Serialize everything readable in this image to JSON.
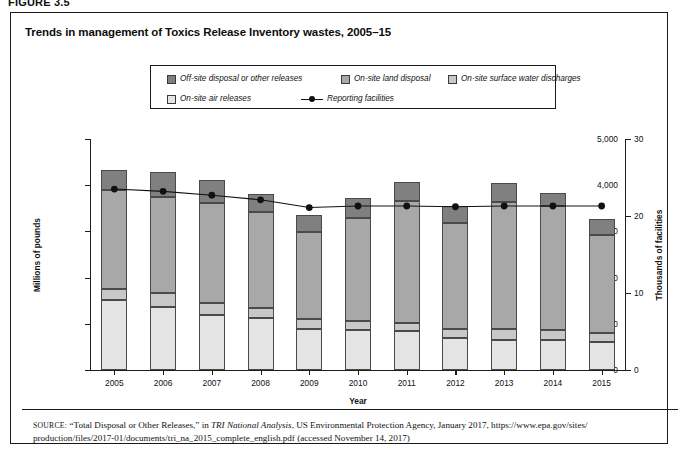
{
  "figure": {
    "number": "FIGURE 3.5"
  },
  "chart_title": "Trends in management of Toxics Release Inventory wastes, 2005–15",
  "legend": {
    "items": [
      {
        "label": "Off-site disposal or other releases",
        "color": "#808080",
        "type": "swatch"
      },
      {
        "label": "On-site land disposal",
        "color": "#a8a8a8",
        "type": "swatch"
      },
      {
        "label": "On-site surface water discharges",
        "color": "#c8c8c8",
        "type": "swatch"
      },
      {
        "label": "On-site air releases",
        "color": "#e4e4e4",
        "type": "swatch"
      },
      {
        "label": "Reporting facilities",
        "color": "#111111",
        "type": "line"
      }
    ]
  },
  "axes": {
    "left_title": "Millions of pounds",
    "right_title": "Thousands of facilities",
    "x_title": "Year",
    "left_ticks": [
      "0",
      "1,000",
      "2,000",
      "3,000",
      "4,000",
      "5,000"
    ],
    "right_ticks": [
      "0",
      "10",
      "20",
      "30"
    ]
  },
  "source": {
    "prefix": "SOURCE:",
    "line1_a": " “Total Disposal or Other Releases,” in ",
    "line1_italic": "TRI National Analysis",
    "line1_b": ", US Environmental Protection Agency, January 2017, https://www.epa.gov/sites/",
    "line2": "production/files/2017-01/documents/tri_na_2015_complete_english.pdf (accessed November 14, 2017)"
  },
  "chart_data": {
    "type": "bar",
    "subtype": "stacked-bar-with-line",
    "title": "Trends in management of Toxics Release Inventory wastes, 2005–15",
    "xlabel": "Year",
    "ylabel": "Millions of pounds",
    "y2label": "Thousands of facilities",
    "categories": [
      "2005",
      "2006",
      "2007",
      "2008",
      "2009",
      "2010",
      "2011",
      "2012",
      "2013",
      "2014",
      "2015"
    ],
    "ylim": [
      0,
      5000
    ],
    "y2lim": [
      0,
      30
    ],
    "grid": false,
    "legend_position": "top-center",
    "series": [
      {
        "name": "On-site air releases",
        "color": "#e4e4e4",
        "values": [
          1510,
          1360,
          1200,
          1125,
          895,
          855,
          840,
          700,
          655,
          640,
          600
        ]
      },
      {
        "name": "On-site surface water discharges",
        "color": "#c8c8c8",
        "values": [
          235,
          300,
          250,
          215,
          205,
          215,
          180,
          190,
          235,
          230,
          205
        ]
      },
      {
        "name": "On-site land disposal",
        "color": "#a8a8a8",
        "values": [
          2150,
          2080,
          2160,
          2090,
          1890,
          2230,
          2630,
          2300,
          2750,
          2670,
          2120
        ]
      },
      {
        "name": "Off-site disposal or other releases",
        "color": "#808080",
        "values": [
          425,
          545,
          500,
          375,
          375,
          425,
          410,
          360,
          405,
          300,
          335
        ]
      }
    ],
    "totals": [
      4320,
      4285,
      4110,
      3805,
      3365,
      3725,
      4060,
      3550,
      4045,
      3840,
      3260
    ],
    "line_series": {
      "name": "Reporting facilities",
      "axis": "right",
      "color": "#111111",
      "marker": "circle",
      "values": [
        23.5,
        23.2,
        22.7,
        22.1,
        21.1,
        21.3,
        21.3,
        21.2,
        21.3,
        21.3,
        21.3
      ]
    }
  }
}
